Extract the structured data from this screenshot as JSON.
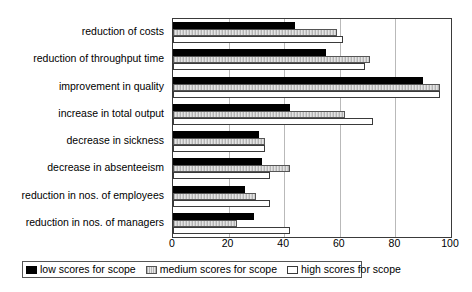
{
  "chart_data": {
    "type": "bar",
    "orientation": "horizontal",
    "title": "",
    "xlabel": "",
    "ylabel": "",
    "xlim": [
      0,
      100
    ],
    "xticks": [
      0,
      20,
      40,
      60,
      80,
      100
    ],
    "grid": true,
    "legend_position": "bottom",
    "categories": [
      "reduction of costs",
      "reduction of throughput time",
      "improvement in quality",
      "increase in total output",
      "decrease in sickness",
      "decrease in absenteeism",
      "reduction in nos. of employees",
      "reduction in nos. of managers"
    ],
    "series": [
      {
        "name": "low scores for scope",
        "color": "#000000",
        "values": [
          44,
          55,
          90,
          42,
          31,
          32,
          26,
          29
        ]
      },
      {
        "name": "medium scores for scope",
        "color": "#c8c8c8",
        "values": [
          59,
          71,
          96,
          62,
          33,
          42,
          30,
          23
        ]
      },
      {
        "name": "high scores for scope",
        "color": "#ffffff",
        "values": [
          61,
          69,
          96,
          72,
          33,
          35,
          35,
          42
        ]
      }
    ]
  },
  "legend": {
    "items": [
      {
        "label": "low scores for scope",
        "swatch": "black-swatch"
      },
      {
        "label": "medium scores for scope",
        "swatch": "hatched-gray-swatch"
      },
      {
        "label": "high scores for scope",
        "swatch": "white-swatch"
      }
    ]
  }
}
